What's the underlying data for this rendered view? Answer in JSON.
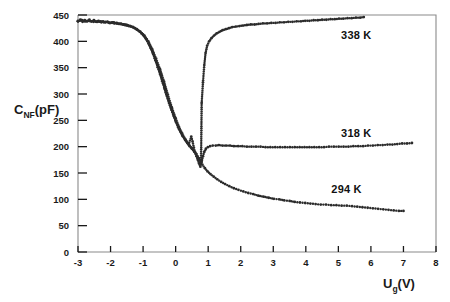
{
  "chart_data": {
    "type": "scatter",
    "title": "",
    "xlabel": "U_g(V)",
    "xlabel_main": "U",
    "xlabel_sub": "g",
    "xlabel_tail": "(V)",
    "ylabel": "C_NF(pF)",
    "ylabel_main": "C",
    "ylabel_sub": "NF",
    "ylabel_tail": "(pF)",
    "xlim": [
      -3,
      8
    ],
    "ylim": [
      0,
      450
    ],
    "xticks": [
      -3,
      -2,
      -1,
      0,
      1,
      2,
      3,
      4,
      5,
      6,
      7,
      8
    ],
    "xticklabels": [
      "-3",
      "-2",
      "-1",
      "0",
      "1",
      "2",
      "3",
      "4",
      "5",
      "6",
      "7",
      "8"
    ],
    "yticks": [
      0,
      50,
      100,
      150,
      200,
      250,
      300,
      350,
      400,
      450
    ],
    "yticklabels": [
      "0",
      "50",
      "100",
      "150",
      "200",
      "250",
      "300",
      "350",
      "400",
      "450"
    ],
    "grid": false,
    "legend_position": "inline-annotations",
    "marker_color": "#2b2b2b",
    "marker_size": 1.4,
    "series": [
      {
        "name": "338 K",
        "label": "338 K",
        "label_x": 5.55,
        "label_y": 405,
        "points": [
          [
            -3.0,
            438
          ],
          [
            -2.93,
            441
          ],
          [
            -2.86,
            437
          ],
          [
            -2.79,
            440
          ],
          [
            -2.72,
            438
          ],
          [
            -2.65,
            441
          ],
          [
            -2.58,
            438
          ],
          [
            -2.51,
            440
          ],
          [
            -2.44,
            437
          ],
          [
            -2.37,
            439
          ],
          [
            -2.3,
            437
          ],
          [
            -2.23,
            438
          ],
          [
            -2.16,
            436
          ],
          [
            -2.09,
            437
          ],
          [
            -2.02,
            435
          ],
          [
            -1.95,
            436
          ],
          [
            -1.88,
            434
          ],
          [
            -1.81,
            435
          ],
          [
            -1.74,
            433
          ],
          [
            -1.67,
            433
          ],
          [
            -1.6,
            432
          ],
          [
            -1.53,
            431
          ],
          [
            -1.46,
            430
          ],
          [
            -1.39,
            429
          ],
          [
            -1.32,
            427
          ],
          [
            -1.25,
            425
          ],
          [
            -1.18,
            422
          ],
          [
            -1.11,
            419
          ],
          [
            -1.04,
            415
          ],
          [
            -0.97,
            410
          ],
          [
            -0.9,
            404
          ],
          [
            -0.83,
            396
          ],
          [
            -0.76,
            387
          ],
          [
            -0.69,
            376
          ],
          [
            -0.62,
            364
          ],
          [
            -0.55,
            351
          ],
          [
            -0.48,
            338
          ],
          [
            -0.41,
            324
          ],
          [
            -0.34,
            310
          ],
          [
            -0.27,
            296
          ],
          [
            -0.2,
            283
          ],
          [
            -0.13,
            270
          ],
          [
            -0.06,
            258
          ],
          [
            0.01,
            247
          ],
          [
            0.08,
            237
          ],
          [
            0.15,
            228
          ],
          [
            0.22,
            220
          ],
          [
            0.29,
            213
          ],
          [
            0.36,
            207
          ],
          [
            0.43,
            201
          ],
          [
            0.5,
            196
          ],
          [
            0.57,
            191
          ],
          [
            0.64,
            186
          ],
          [
            0.71,
            178
          ],
          [
            0.78,
            167
          ],
          [
            0.8,
            283
          ],
          [
            0.84,
            322
          ],
          [
            0.88,
            355
          ],
          [
            0.92,
            378
          ],
          [
            0.97,
            392
          ],
          [
            1.03,
            400
          ],
          [
            1.1,
            406
          ],
          [
            1.18,
            411
          ],
          [
            1.26,
            415
          ],
          [
            1.35,
            418
          ],
          [
            1.44,
            421
          ],
          [
            1.54,
            423
          ],
          [
            1.64,
            425
          ],
          [
            1.74,
            427
          ],
          [
            1.85,
            428
          ],
          [
            1.96,
            429
          ],
          [
            2.07,
            430
          ],
          [
            2.19,
            431
          ],
          [
            2.31,
            432
          ],
          [
            2.43,
            432
          ],
          [
            2.55,
            433
          ],
          [
            2.68,
            434
          ],
          [
            2.81,
            434
          ],
          [
            2.94,
            435
          ],
          [
            3.07,
            435
          ],
          [
            3.2,
            436
          ],
          [
            3.33,
            436
          ],
          [
            3.46,
            437
          ],
          [
            3.59,
            437
          ],
          [
            3.72,
            438
          ],
          [
            3.85,
            438
          ],
          [
            3.98,
            439
          ],
          [
            4.11,
            439
          ],
          [
            4.24,
            440
          ],
          [
            4.37,
            440
          ],
          [
            4.5,
            441
          ],
          [
            4.63,
            441
          ],
          [
            4.76,
            442
          ],
          [
            4.89,
            442
          ],
          [
            5.02,
            443
          ],
          [
            5.15,
            443
          ],
          [
            5.28,
            444
          ],
          [
            5.41,
            444
          ],
          [
            5.54,
            445
          ],
          [
            5.67,
            445
          ],
          [
            5.78,
            446
          ]
        ]
      },
      {
        "name": "318 K",
        "label": "318 K",
        "label_x": 5.55,
        "label_y": 218,
        "points": [
          [
            -3.0,
            438
          ],
          [
            -2.9,
            440
          ],
          [
            -2.8,
            438
          ],
          [
            -2.7,
            439
          ],
          [
            -2.6,
            438
          ],
          [
            -2.5,
            439
          ],
          [
            -2.4,
            437
          ],
          [
            -2.3,
            438
          ],
          [
            -2.2,
            436
          ],
          [
            -2.1,
            437
          ],
          [
            -2.0,
            435
          ],
          [
            -1.9,
            436
          ],
          [
            -1.8,
            434
          ],
          [
            -1.7,
            433
          ],
          [
            -1.6,
            432
          ],
          [
            -1.5,
            431
          ],
          [
            -1.4,
            429
          ],
          [
            -1.3,
            427
          ],
          [
            -1.2,
            423
          ],
          [
            -1.1,
            418
          ],
          [
            -1.0,
            412
          ],
          [
            -0.9,
            404
          ],
          [
            -0.8,
            392
          ],
          [
            -0.7,
            378
          ],
          [
            -0.6,
            361
          ],
          [
            -0.5,
            344
          ],
          [
            -0.4,
            326
          ],
          [
            -0.3,
            303
          ],
          [
            -0.2,
            283
          ],
          [
            -0.1,
            266
          ],
          [
            0.0,
            249
          ],
          [
            0.1,
            234
          ],
          [
            0.2,
            222
          ],
          [
            0.3,
            212
          ],
          [
            0.4,
            204
          ],
          [
            0.48,
            219
          ],
          [
            0.52,
            210
          ],
          [
            0.56,
            198
          ],
          [
            0.6,
            189
          ],
          [
            0.64,
            182
          ],
          [
            0.68,
            175
          ],
          [
            0.72,
            168
          ],
          [
            0.76,
            162
          ],
          [
            0.8,
            171
          ],
          [
            0.84,
            182
          ],
          [
            0.88,
            190
          ],
          [
            0.93,
            196
          ],
          [
            0.99,
            199
          ],
          [
            1.06,
            201
          ],
          [
            1.14,
            202
          ],
          [
            1.23,
            202
          ],
          [
            1.33,
            203
          ],
          [
            1.44,
            202
          ],
          [
            1.55,
            202
          ],
          [
            1.67,
            202
          ],
          [
            1.79,
            201
          ],
          [
            1.92,
            201
          ],
          [
            2.05,
            201
          ],
          [
            2.19,
            200
          ],
          [
            2.33,
            200
          ],
          [
            2.47,
            200
          ],
          [
            2.61,
            200
          ],
          [
            2.76,
            199
          ],
          [
            2.91,
            199
          ],
          [
            3.06,
            199
          ],
          [
            3.21,
            199
          ],
          [
            3.36,
            199
          ],
          [
            3.51,
            199
          ],
          [
            3.66,
            199
          ],
          [
            3.81,
            199
          ],
          [
            3.96,
            199
          ],
          [
            4.11,
            199
          ],
          [
            4.26,
            199
          ],
          [
            4.41,
            199
          ],
          [
            4.56,
            199
          ],
          [
            4.71,
            200
          ],
          [
            4.86,
            200
          ],
          [
            5.01,
            200
          ],
          [
            5.16,
            200
          ],
          [
            5.31,
            200
          ],
          [
            5.46,
            201
          ],
          [
            5.61,
            201
          ],
          [
            5.76,
            201
          ],
          [
            5.91,
            202
          ],
          [
            6.06,
            202
          ],
          [
            6.21,
            203
          ],
          [
            6.36,
            203
          ],
          [
            6.51,
            204
          ],
          [
            6.66,
            204
          ],
          [
            6.81,
            205
          ],
          [
            6.96,
            206
          ],
          [
            7.11,
            206
          ],
          [
            7.26,
            207
          ]
        ]
      },
      {
        "name": "294 K",
        "label": "294 K",
        "label_x": 5.25,
        "label_y": 112,
        "points": [
          [
            -3.0,
            439
          ],
          [
            -2.88,
            440
          ],
          [
            -2.76,
            438
          ],
          [
            -2.64,
            439
          ],
          [
            -2.52,
            437
          ],
          [
            -2.4,
            438
          ],
          [
            -2.28,
            436
          ],
          [
            -2.16,
            437
          ],
          [
            -2.04,
            435
          ],
          [
            -1.92,
            435
          ],
          [
            -1.8,
            434
          ],
          [
            -1.68,
            433
          ],
          [
            -1.56,
            431
          ],
          [
            -1.44,
            429
          ],
          [
            -1.32,
            427
          ],
          [
            -1.2,
            423
          ],
          [
            -1.08,
            418
          ],
          [
            -0.96,
            411
          ],
          [
            -0.84,
            400
          ],
          [
            -0.72,
            385
          ],
          [
            -0.6,
            367
          ],
          [
            -0.48,
            347
          ],
          [
            -0.36,
            324
          ],
          [
            -0.24,
            299
          ],
          [
            -0.12,
            275
          ],
          [
            0.0,
            254
          ],
          [
            0.1,
            238
          ],
          [
            0.2,
            225
          ],
          [
            0.3,
            214
          ],
          [
            0.4,
            205
          ],
          [
            0.5,
            197
          ],
          [
            0.58,
            190
          ],
          [
            0.66,
            182
          ],
          [
            0.74,
            174
          ],
          [
            0.82,
            166
          ],
          [
            0.9,
            159
          ],
          [
            0.98,
            153
          ],
          [
            1.07,
            148
          ],
          [
            1.17,
            143
          ],
          [
            1.28,
            138
          ],
          [
            1.4,
            133
          ],
          [
            1.52,
            129
          ],
          [
            1.65,
            125
          ],
          [
            1.79,
            121
          ],
          [
            1.93,
            118
          ],
          [
            2.08,
            115
          ],
          [
            2.23,
            112
          ],
          [
            2.38,
            110
          ],
          [
            2.54,
            107
          ],
          [
            2.7,
            105
          ],
          [
            2.86,
            103
          ],
          [
            3.02,
            101
          ],
          [
            3.18,
            100
          ],
          [
            3.34,
            98
          ],
          [
            3.5,
            97
          ],
          [
            3.66,
            95
          ],
          [
            3.82,
            94
          ],
          [
            3.98,
            93
          ],
          [
            4.14,
            92
          ],
          [
            4.3,
            91
          ],
          [
            4.46,
            90
          ],
          [
            4.62,
            90
          ],
          [
            4.78,
            89
          ],
          [
            4.94,
            89
          ],
          [
            5.1,
            88
          ],
          [
            5.26,
            88
          ],
          [
            5.42,
            87
          ],
          [
            5.58,
            86
          ],
          [
            5.74,
            85
          ],
          [
            5.9,
            84
          ],
          [
            6.06,
            83
          ],
          [
            6.22,
            82
          ],
          [
            6.38,
            81
          ],
          [
            6.54,
            80
          ],
          [
            6.7,
            79
          ],
          [
            6.86,
            78
          ],
          [
            7.0,
            78
          ]
        ]
      }
    ]
  }
}
